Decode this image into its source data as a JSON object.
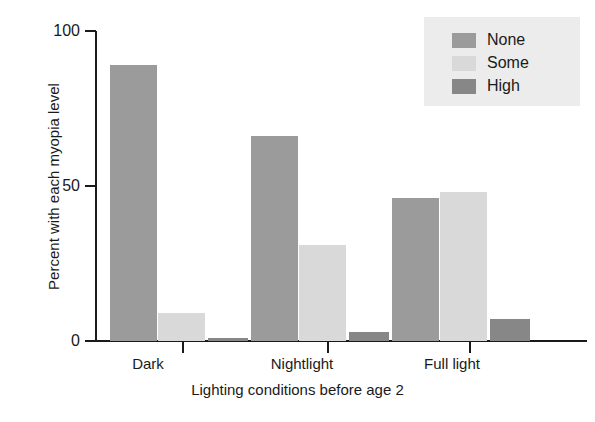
{
  "chart_data": {
    "type": "bar",
    "title": "",
    "subtitle": "",
    "xlabel": "Lighting conditions before age 2",
    "ylabel": "Percent with each myopia level",
    "categories": [
      "Dark",
      "Nightlight",
      "Full light"
    ],
    "series": [
      {
        "name": "None",
        "color": "#9b9b9b",
        "values": [
          89,
          66,
          46
        ]
      },
      {
        "name": "Some",
        "color": "#d9d9d9",
        "values": [
          9,
          31,
          48
        ]
      },
      {
        "name": "High",
        "color": "#878787",
        "values": [
          1,
          3,
          7
        ]
      }
    ],
    "ylim": [
      0,
      100
    ],
    "yticks": [
      0,
      50,
      100
    ],
    "ytick_labels": [
      "0",
      "50",
      "100"
    ],
    "grid": false,
    "legend_position": "top-right",
    "legend_entries": [
      "None",
      "Some",
      "High"
    ],
    "legend_background": "#ececec",
    "axis_color": "#1a1a1a",
    "background": "#ffffff"
  }
}
